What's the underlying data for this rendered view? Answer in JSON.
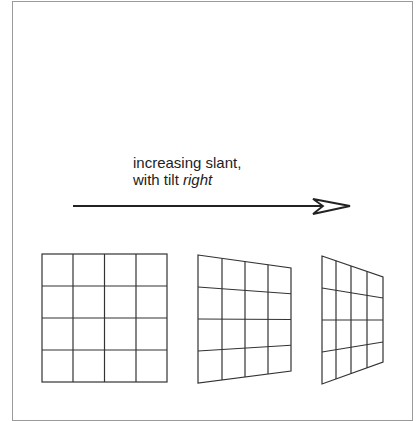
{
  "figure": {
    "caption_line1": "increasing slant,",
    "caption_line2_prefix": "with tilt ",
    "caption_line2_emphasis": "right",
    "arrow": {
      "direction": "right",
      "meaning": "increasing slant"
    },
    "grids": [
      {
        "label": "frontal grid (no slant)",
        "rows": 4,
        "cols": 4
      },
      {
        "label": "moderate slant grid",
        "rows": 4,
        "cols": 4
      },
      {
        "label": "strong slant grid",
        "rows": 4,
        "cols": 4
      }
    ],
    "colors": {
      "line": "#333333",
      "border": "#9a9a9a"
    }
  }
}
